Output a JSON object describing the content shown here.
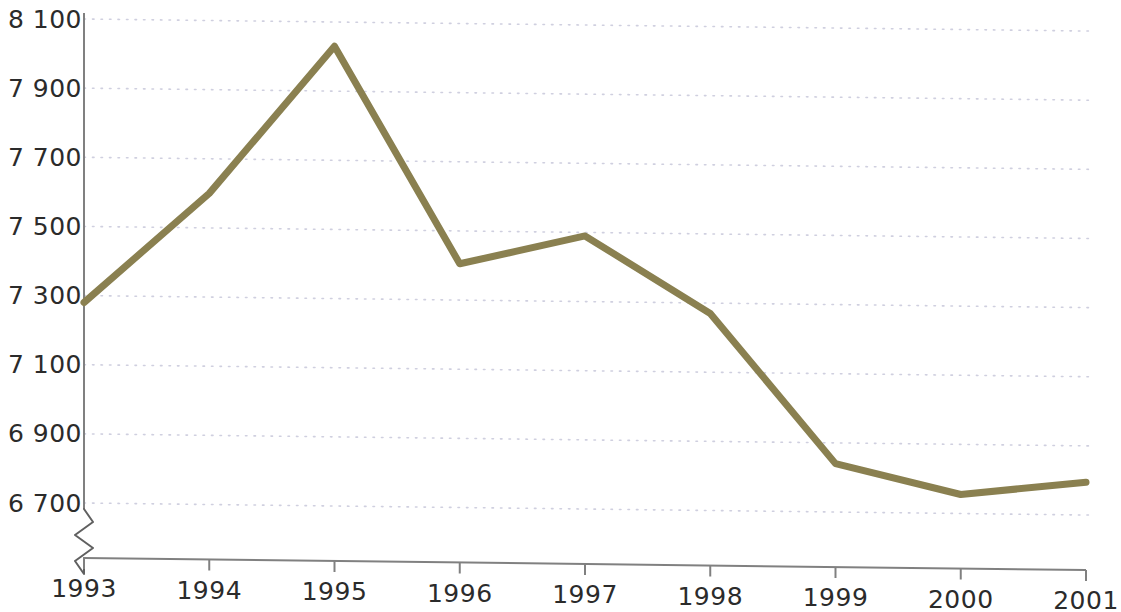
{
  "chart_data": {
    "type": "line",
    "title": "",
    "subtitle": "",
    "xlabel": "",
    "ylabel": "",
    "categories": [
      "1993",
      "1994",
      "1995",
      "1996",
      "1997",
      "1998",
      "1999",
      "2000",
      "2001"
    ],
    "x": [
      1993,
      1994,
      1995,
      1996,
      1997,
      1998,
      1999,
      2000,
      2001
    ],
    "values": [
      7280,
      7600,
      8030,
      7405,
      7490,
      7270,
      6840,
      6755,
      6795
    ],
    "series": [
      {
        "name": "",
        "values": [
          7280,
          7600,
          8030,
          7405,
          7490,
          7270,
          6840,
          6755,
          6795
        ],
        "color": "#8a8050"
      }
    ],
    "ylim": [
      6620,
      8100
    ],
    "yticks": [
      6700,
      6900,
      7100,
      7300,
      7500,
      7700,
      7900,
      8100
    ],
    "ytick_labels": [
      "6 700",
      "6 900",
      "7 100",
      "7 300",
      "7 500",
      "7 700",
      "7 900",
      "8 100"
    ],
    "xtick_labels": [
      "1993",
      "1994",
      "1995",
      "1996",
      "1997",
      "1998",
      "1999",
      "2000",
      "2001"
    ],
    "grid": true,
    "grid_style": "dotted-horizontal",
    "legend": false,
    "legend_position": "none",
    "axis_break": true,
    "axis_break_note": "zigzag break on y-axis below 6 700",
    "colors": {
      "line": "#8a8050",
      "axis": "#808080",
      "grid": "#cfcfdf",
      "text": "#2b2b2b",
      "background": "#ffffff"
    }
  }
}
